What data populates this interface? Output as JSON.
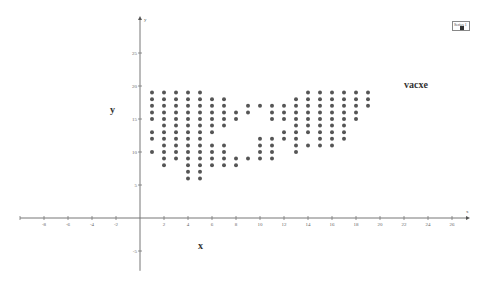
{
  "chart_data": {
    "type": "scatter",
    "title": "",
    "xlabel": "x",
    "ylabel": "y",
    "axis_arrow_labels": {
      "x": "x",
      "y": "y"
    },
    "annotations": [
      "vacxe"
    ],
    "legend": {
      "entries": [
        "Series 1"
      ],
      "position": "top-right"
    },
    "grid": false,
    "xlim": [
      -10,
      27
    ],
    "ylim": [
      -8,
      30
    ],
    "x_ticks": [
      -8,
      -6,
      -4,
      -2,
      2,
      4,
      6,
      8,
      10,
      12,
      14,
      16,
      18,
      20,
      22,
      24,
      26
    ],
    "y_ticks": [
      -5,
      5,
      10,
      15,
      20,
      25
    ],
    "marker_color": "#555555",
    "series": [
      {
        "name": "Series 1",
        "points_by_column": {
          "1": [
            19,
            18,
            17,
            16,
            15,
            13,
            12,
            10
          ],
          "2": [
            19,
            18,
            17,
            16,
            15,
            14,
            13,
            12,
            11,
            10,
            9,
            8
          ],
          "3": [
            19,
            18,
            17,
            16,
            15,
            14,
            13,
            12,
            11,
            10,
            9
          ],
          "4": [
            19,
            18,
            17,
            16,
            15,
            14,
            13,
            12,
            11,
            10,
            9,
            8,
            7,
            6
          ],
          "5": [
            19,
            18,
            17,
            16,
            15,
            14,
            13,
            12,
            11,
            10,
            9,
            8,
            7,
            6
          ],
          "6": [
            18,
            17,
            16,
            15,
            14,
            13,
            11,
            10,
            9,
            8
          ],
          "7": [
            18,
            17,
            16,
            15,
            14,
            11,
            10,
            9,
            8
          ],
          "8": [
            16,
            15,
            9,
            8
          ],
          "9": [
            17,
            16,
            9
          ],
          "10": [
            17,
            12,
            11,
            10,
            9
          ],
          "11": [
            17,
            16,
            15,
            12,
            11,
            10,
            9
          ],
          "12": [
            17,
            16,
            15,
            13,
            12
          ],
          "13": [
            18,
            17,
            16,
            15,
            14,
            13,
            12,
            11,
            10
          ],
          "14": [
            19,
            18,
            17,
            16,
            15,
            14,
            13,
            11
          ],
          "15": [
            19,
            18,
            17,
            16,
            15,
            14,
            13,
            12,
            11
          ],
          "16": [
            19,
            18,
            17,
            16,
            15,
            14,
            13,
            12,
            11
          ],
          "17": [
            19,
            18,
            17,
            16,
            15,
            14,
            13,
            12
          ],
          "18": [
            19,
            18,
            17,
            16,
            15
          ],
          "19": [
            19,
            18,
            17
          ]
        }
      }
    ]
  },
  "labels": {
    "x_axis_big": "x",
    "y_axis_big": "y",
    "annotation": "vacxe",
    "legend_series": "Series 1"
  },
  "layout": {
    "origin_px": [
      140,
      218
    ],
    "px_per_x": 12,
    "px_per_y": 6.6
  }
}
